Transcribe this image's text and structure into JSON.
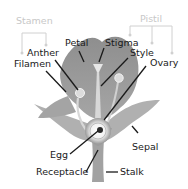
{
  "groups": {
    "stamen": "Stamen",
    "pistil": "Pistil"
  },
  "labels": {
    "petal": "Petal",
    "stigma": "Stigma",
    "anther": "Anther",
    "style": "Style",
    "filament": "Filamen",
    "ovary": "Ovary",
    "egg": "Egg",
    "sepal": "Sepal",
    "receptacle": "Receptacle",
    "stalk": "Stalk"
  },
  "colors": {
    "petal": "#9a9a9a",
    "sepal": "#a8a8a8",
    "stalk": "#a0a0a0",
    "highlight": "#e8e8e8",
    "label_text": "#1a1a1a",
    "group_text": "#c8c8c8"
  }
}
